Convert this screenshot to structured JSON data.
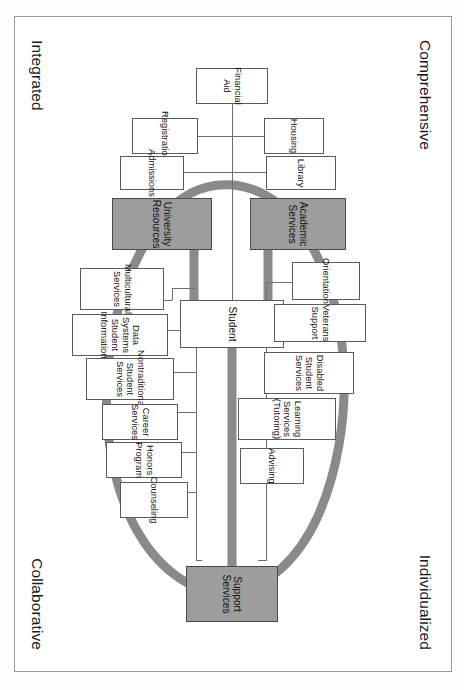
{
  "diagram": {
    "orientation": "rotated-90-clockwise",
    "corner_labels": {
      "top_left": "Comprehensive",
      "top_right": "Individualized",
      "bottom_left": "Integrated",
      "bottom_right": "Collaborative"
    },
    "colors": {
      "shaded_fill": "#9d9d9d",
      "ring": "#8a8a8a",
      "connector": "#8a8a8a",
      "box_border": "#5b5b5b",
      "thin_line": "#6e6e6e",
      "frame": "#9a9a9a",
      "text": "#111111"
    },
    "center_node": {
      "label": "Student"
    },
    "category_nodes": [
      {
        "id": "academic-services",
        "label": "Academic\nServices"
      },
      {
        "id": "support-services",
        "label": "Support\nServices"
      },
      {
        "id": "university-resources",
        "label": "University\nResources"
      }
    ],
    "service_nodes": [
      {
        "id": "housing",
        "label": "Housing"
      },
      {
        "id": "library",
        "label": "Library"
      },
      {
        "id": "orientation",
        "label": "Orientation"
      },
      {
        "id": "veterans-support",
        "label": "Veterans Support"
      },
      {
        "id": "disabled-student-services",
        "label": "Disabled Student\nServices"
      },
      {
        "id": "learning-services",
        "label": "Learning Services\n(Tutoring)"
      },
      {
        "id": "advising",
        "label": "Advising"
      },
      {
        "id": "financial-aid",
        "label": "Financial Aid"
      },
      {
        "id": "registration",
        "label": "Registration"
      },
      {
        "id": "admissions",
        "label": "Admissions"
      },
      {
        "id": "multicultural-services",
        "label": "Multicultural\nServices"
      },
      {
        "id": "data-systems",
        "label": "Data Systems\nStudent Information"
      },
      {
        "id": "nontraditional-student-services",
        "label": "Nontraditional\nStudent Services"
      },
      {
        "id": "career-services",
        "label": "Career Services"
      },
      {
        "id": "honors-program",
        "label": "Honors Program"
      },
      {
        "id": "counseling",
        "label": "Counseling"
      }
    ]
  }
}
